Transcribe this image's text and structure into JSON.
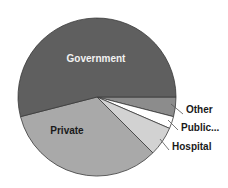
{
  "chart_data": {
    "type": "pie",
    "title": "",
    "start": "3 o'clock",
    "direction": "clockwise",
    "slices": [
      {
        "label": "Other",
        "value": 4,
        "color": "#8c8c8c",
        "label_position": "outside",
        "text_style": "dark"
      },
      {
        "label": "Public...",
        "value": 2.5,
        "color": "#ffffff",
        "label_position": "outside",
        "text_style": "dark"
      },
      {
        "label": "Hospital",
        "value": 6,
        "color": "#d2d2d2",
        "label_position": "outside",
        "text_style": "dark"
      },
      {
        "label": "Private",
        "value": 33.5,
        "color": "#a9a9a9",
        "label_position": "inside",
        "text_style": "dark"
      },
      {
        "label": "Government",
        "value": 54,
        "color": "#5f5f5f",
        "label_position": "inside",
        "text_style": "light"
      }
    ],
    "legend": "none",
    "units": "percent (estimated from slice angles)"
  }
}
